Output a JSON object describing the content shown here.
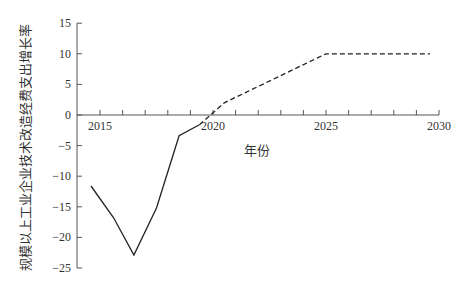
{
  "chart_data": {
    "type": "line",
    "title": "",
    "xlabel": "年份",
    "ylabel": "规模以上工业企业技术改造经费支出增长率",
    "xlim": [
      2014.5,
      2030
    ],
    "ylim": [
      -25,
      15
    ],
    "x_ticks": [
      2015,
      2020,
      2025,
      2030
    ],
    "x_minor_ticks_per_year": true,
    "y_ticks": [
      15,
      10,
      5,
      0,
      -5,
      -10,
      -15,
      -20,
      -25
    ],
    "grid": false,
    "legend": null,
    "x_axis_position": "y=0",
    "series": [
      {
        "name": "actual",
        "style": "solid",
        "color": "#222222",
        "points": [
          {
            "x": 2014.6,
            "y": -11.6
          },
          {
            "x": 2015.6,
            "y": -16.8
          },
          {
            "x": 2016.5,
            "y": -22.9
          },
          {
            "x": 2017.5,
            "y": -15.2
          },
          {
            "x": 2018.5,
            "y": -3.4
          },
          {
            "x": 2019.4,
            "y": -1.6
          }
        ]
      },
      {
        "name": "projected",
        "style": "dashed",
        "color": "#222222",
        "points": [
          {
            "x": 2019.4,
            "y": -1.6
          },
          {
            "x": 2020.5,
            "y": 2.0
          },
          {
            "x": 2025.0,
            "y": 10.0
          },
          {
            "x": 2029.6,
            "y": 10.0
          }
        ]
      }
    ]
  },
  "labels": {
    "xlabel": "年份",
    "ylabel": "规模以上工业企业技术改造经费支出增长率"
  }
}
